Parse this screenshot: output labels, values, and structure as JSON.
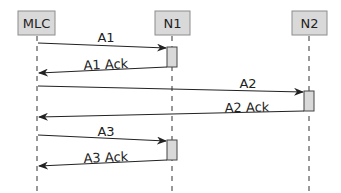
{
  "diagram": {
    "type": "sequence",
    "actors": [
      {
        "id": "MLC",
        "label": "MLC",
        "x": 37
      },
      {
        "id": "N1",
        "label": "N1",
        "x": 172
      },
      {
        "id": "N2",
        "label": "N2",
        "x": 309
      }
    ],
    "messages": [
      {
        "label": "A1",
        "from": "MLC",
        "to": "N1"
      },
      {
        "label": "A1 Ack",
        "from": "N1",
        "to": "MLC"
      },
      {
        "label": "A2",
        "from": "MLC",
        "to": "N2"
      },
      {
        "label": "A2 Ack",
        "from": "N2",
        "to": "MLC"
      },
      {
        "label": "A3",
        "from": "MLC",
        "to": "N1"
      },
      {
        "label": "A3 Ack",
        "from": "N1",
        "to": "MLC"
      }
    ],
    "colors": {
      "actor_fill": "#d9d9d9",
      "actor_stroke": "#8c8c8c",
      "line": "#222222"
    }
  }
}
